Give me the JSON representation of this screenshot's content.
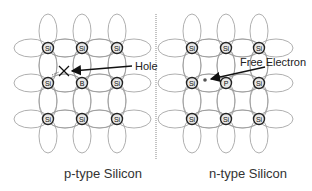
{
  "diagram": {
    "left_panel": {
      "caption": "p-type Silicon",
      "atoms": [
        [
          "Si",
          "Si",
          "Si"
        ],
        [
          "Si",
          "B",
          "Si"
        ],
        [
          "Si",
          "Si",
          "Si"
        ]
      ],
      "annotation": "Hole"
    },
    "right_panel": {
      "caption": "n-type Silicon",
      "atoms": [
        [
          "Si",
          "Si",
          "Si"
        ],
        [
          "Si",
          "P",
          "Si"
        ],
        [
          "Si",
          "Si",
          "Si"
        ]
      ],
      "annotation": "Free Electron"
    },
    "colors": {
      "bond": "#9a9a9a",
      "atom_fill": "#e8e8e8",
      "atom_stroke": "#222222",
      "arrow": "#111111",
      "divider": "#888888"
    }
  }
}
